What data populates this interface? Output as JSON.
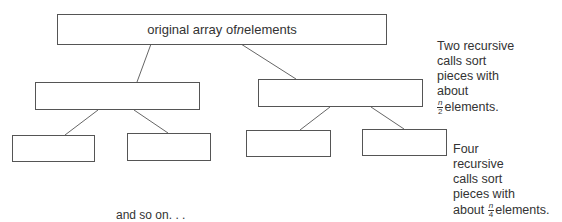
{
  "diagram": {
    "root": {
      "label_pre": "original array of ",
      "label_var": "n",
      "label_post": " elements"
    },
    "level1_note": {
      "lines": [
        "Two recursive",
        "calls sort",
        "pieces with",
        "about"
      ],
      "frac_num": "n",
      "frac_den": "2",
      "suffix": "elements."
    },
    "level2_note": {
      "lines": [
        "Four",
        "recursive",
        "calls sort",
        "pieces with"
      ],
      "prefix": "about ",
      "frac_num": "n",
      "frac_den": "4",
      "suffix": "elements."
    },
    "continuation": "and so on. . ."
  }
}
